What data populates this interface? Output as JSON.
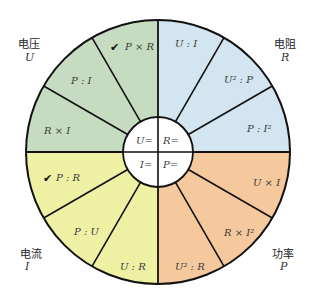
{
  "diagram": {
    "center": {
      "x": 158,
      "y": 152
    },
    "outer_radius": 132,
    "inner_radius": 35,
    "stroke_color": "#111111",
    "quadrants": [
      {
        "id": "voltage",
        "name_cn": "电压",
        "symbol": "U",
        "center_label": "U=",
        "color": "#c6dcc0",
        "formulas": [
          {
            "text": "P × R",
            "checked": true
          },
          {
            "text": "P : I",
            "checked": false
          },
          {
            "text": "R × I",
            "checked": false
          }
        ]
      },
      {
        "id": "resistance",
        "name_cn": "电阻",
        "symbol": "R",
        "center_label": "R=",
        "color": "#d2e5f0",
        "formulas": [
          {
            "text": "U : I",
            "checked": false
          },
          {
            "text": "U² : P",
            "checked": false
          },
          {
            "text": "P : I²",
            "checked": false
          }
        ]
      },
      {
        "id": "power",
        "name_cn": "功率",
        "symbol": "P",
        "center_label": "P=",
        "color": "#f5c89e",
        "formulas": [
          {
            "text": "U × I",
            "checked": false
          },
          {
            "text": "R × I²",
            "checked": false
          },
          {
            "text": "U² : R",
            "checked": false
          }
        ]
      },
      {
        "id": "current",
        "name_cn": "电流",
        "symbol": "I",
        "center_label": "I=",
        "color": "#eef0a4",
        "formulas": [
          {
            "text": "U : R",
            "checked": false
          },
          {
            "text": "P : U",
            "checked": false
          },
          {
            "text": "P : R",
            "checked": true
          }
        ]
      }
    ],
    "check_glyph": "✔"
  }
}
